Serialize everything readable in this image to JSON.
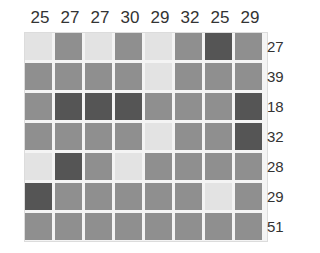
{
  "puzzle": {
    "column_sums": [
      "25",
      "27",
      "27",
      "30",
      "29",
      "32",
      "25",
      "29"
    ],
    "row_sums": [
      "27",
      "39",
      "18",
      "32",
      "28",
      "29",
      "51"
    ],
    "shade_colors": {
      "light": "#e3e3e3",
      "medium": "#8f8f8f",
      "dark": "#555555"
    },
    "grid": [
      [
        "light",
        "medium",
        "light",
        "medium",
        "light",
        "medium",
        "dark",
        "medium"
      ],
      [
        "medium",
        "medium",
        "medium",
        "medium",
        "light",
        "medium",
        "medium",
        "medium"
      ],
      [
        "medium",
        "dark",
        "dark",
        "dark",
        "medium",
        "medium",
        "medium",
        "dark"
      ],
      [
        "medium",
        "medium",
        "medium",
        "medium",
        "light",
        "medium",
        "medium",
        "dark"
      ],
      [
        "light",
        "dark",
        "medium",
        "light",
        "medium",
        "medium",
        "medium",
        "medium"
      ],
      [
        "dark",
        "medium",
        "medium",
        "medium",
        "medium",
        "medium",
        "light",
        "medium"
      ],
      [
        "medium",
        "medium",
        "medium",
        "medium",
        "medium",
        "medium",
        "medium",
        "medium"
      ]
    ]
  }
}
